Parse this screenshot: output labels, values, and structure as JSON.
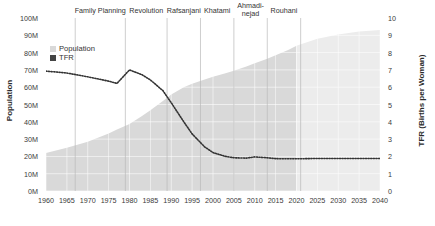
{
  "chart_data": {
    "type": "area",
    "title": "",
    "xlabel": "",
    "ylabel": "Population",
    "y2label": "TFR (Births per Woman)",
    "grid": true,
    "legend_position": "top-left",
    "xlim": [
      1960,
      2040
    ],
    "ylim": [
      0,
      100
    ],
    "y2lim": [
      0,
      10
    ],
    "x_ticks": [
      "1960",
      "1965",
      "1970",
      "1975",
      "1980",
      "1985",
      "1990",
      "1995",
      "2000",
      "2005",
      "2010",
      "2015",
      "2020",
      "2025",
      "2030",
      "2035",
      "2040"
    ],
    "y_left_ticks": [
      "0M",
      "10M",
      "20M",
      "30M",
      "40M",
      "50M",
      "60M",
      "70M",
      "80M",
      "90M",
      "100M"
    ],
    "y_right_ticks": [
      "0",
      "1",
      "2",
      "3",
      "4",
      "5",
      "6",
      "7",
      "8",
      "9",
      "10"
    ],
    "x": [
      1960,
      1965,
      1970,
      1975,
      1977,
      1980,
      1983,
      1985,
      1988,
      1990,
      1993,
      1995,
      1998,
      2000,
      2003,
      2005,
      2008,
      2010,
      2013,
      2015,
      2018,
      2020,
      2025,
      2030,
      2035,
      2040
    ],
    "series": [
      {
        "name": "Population",
        "unit": "millions",
        "axis": "left",
        "color": "#d9d9d9",
        "projection_color": "#ececec",
        "projection_starts": 2020,
        "values": [
          22.0,
          25.0,
          28.5,
          33.3,
          35.5,
          38.7,
          43.4,
          46.7,
          52.0,
          55.8,
          60.0,
          62.0,
          64.4,
          66.0,
          68.0,
          69.5,
          72.0,
          73.8,
          76.5,
          78.5,
          81.5,
          84.0,
          88.0,
          90.5,
          92.2,
          93.0
        ]
      },
      {
        "name": "TFR",
        "unit": "births per woman",
        "axis": "right",
        "color": "#333333",
        "values": [
          6.93,
          6.82,
          6.6,
          6.35,
          6.22,
          7.0,
          6.72,
          6.42,
          5.8,
          5.1,
          4.0,
          3.3,
          2.55,
          2.22,
          2.0,
          1.92,
          1.9,
          1.97,
          1.92,
          1.87,
          1.86,
          1.86,
          1.88,
          1.88,
          1.88,
          1.88
        ]
      }
    ],
    "annotations": [
      {
        "label": "Family Planning",
        "x_start": 1967,
        "x_end": 1979
      },
      {
        "label": "Revolution",
        "x_start": 1979,
        "x_end": 1989
      },
      {
        "label": "Rafsanjani",
        "x_start": 1989,
        "x_end": 1997
      },
      {
        "label": "Khatami",
        "x_start": 1997,
        "x_end": 2005
      },
      {
        "label": "Ahmadi-\nnejad",
        "x_start": 2005,
        "x_end": 2013
      },
      {
        "label": "Rouhani",
        "x_start": 2013,
        "x_end": 2021
      }
    ]
  },
  "legend": {
    "items": [
      {
        "label": "Population",
        "color": "#d9d9d9"
      },
      {
        "label": "TFR",
        "color": "#444444"
      }
    ]
  },
  "eras": {
    "family_planning": "Family Planning",
    "revolution": "Revolution",
    "rafsanjani": "Rafsanjani",
    "khatami": "Khatami",
    "ahmadinejad_line1": "Ahmadi-",
    "ahmadinejad_line2": "nejad",
    "rouhani": "Rouhani"
  },
  "axes": {
    "left_title": "Population",
    "right_title": "TFR (Births per Woman)"
  }
}
